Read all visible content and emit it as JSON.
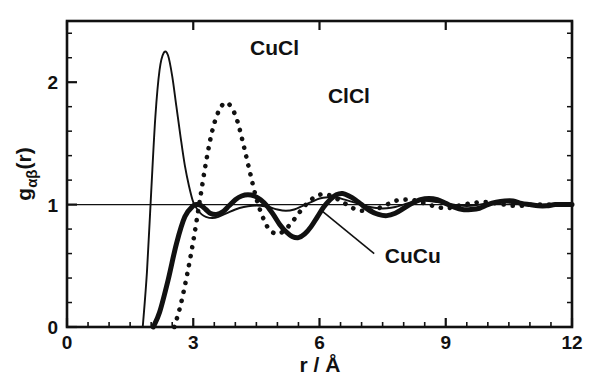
{
  "chart_data": {
    "type": "line",
    "title": "",
    "subtitle": "",
    "xlabel": "r / Å",
    "ylabel": "gαβ(r)",
    "ylabel_parts": {
      "base": "g",
      "subscript": "αβ",
      "suffix": "(r)"
    },
    "xlim": [
      0,
      12
    ],
    "ylim": [
      0,
      2.5
    ],
    "xticks": [
      0,
      3,
      6,
      9,
      12
    ],
    "xtick_labels": [
      "0",
      "3",
      "6",
      "9",
      "12"
    ],
    "yticks": [
      0,
      1,
      2
    ],
    "ytick_labels": [
      "0",
      "1",
      "2"
    ],
    "x_minor_step": 0.5,
    "y_minor_step": 0.2,
    "grid": false,
    "legend_position": "inline-annotations",
    "reference_line_y": 1,
    "annotations": [
      {
        "text": "CuCl",
        "x": 4.35,
        "y": 2.22,
        "leader": false
      },
      {
        "text": "ClCl",
        "x": 6.2,
        "y": 1.83,
        "leader": false
      },
      {
        "text": "CuCu",
        "x": 7.55,
        "y": 0.52,
        "leader": true,
        "leader_from": [
          6.05,
          0.95
        ],
        "leader_to": [
          7.3,
          0.6
        ]
      }
    ],
    "series": [
      {
        "name": "CuCl",
        "label": "CuCl",
        "style": "solid-thin",
        "color": "#111111",
        "x": [
          1.8,
          1.9,
          2.0,
          2.1,
          2.2,
          2.3,
          2.4,
          2.5,
          2.6,
          2.7,
          2.8,
          2.9,
          3.0,
          3.1,
          3.2,
          3.3,
          3.45,
          3.6,
          3.8,
          4.0,
          4.2,
          4.4,
          4.6,
          4.8,
          5.0,
          5.2,
          5.4,
          5.6,
          5.8,
          6.0,
          6.2,
          6.4,
          6.6,
          6.8,
          7.0,
          7.2,
          7.4,
          7.6,
          7.8,
          8.0,
          8.2,
          8.4,
          8.6,
          8.8,
          9.0,
          9.2,
          9.4,
          9.6,
          9.8,
          10.0,
          10.2,
          10.4,
          10.6,
          10.8,
          11.0,
          11.2,
          11.4,
          11.6,
          11.8,
          12.0
        ],
        "y": [
          0.0,
          0.45,
          1.1,
          1.72,
          2.1,
          2.24,
          2.22,
          2.05,
          1.8,
          1.55,
          1.32,
          1.15,
          1.02,
          0.96,
          0.92,
          0.9,
          0.89,
          0.9,
          0.93,
          0.96,
          0.98,
          0.99,
          0.99,
          0.98,
          0.96,
          0.95,
          0.96,
          0.99,
          1.02,
          1.05,
          1.06,
          1.06,
          1.04,
          1.02,
          1.0,
          0.98,
          0.97,
          0.97,
          0.98,
          1.0,
          1.02,
          1.03,
          1.03,
          1.02,
          1.01,
          1.0,
          0.99,
          0.99,
          1.0,
          1.01,
          1.02,
          1.02,
          1.01,
          1.0,
          1.0,
          1.0,
          1.0,
          1.0,
          1.0,
          1.0
        ]
      },
      {
        "name": "ClCl",
        "label": "ClCl",
        "style": "dotted",
        "color": "#111111",
        "x": [
          2.55,
          2.7,
          2.85,
          3.0,
          3.15,
          3.3,
          3.45,
          3.6,
          3.75,
          3.9,
          4.05,
          4.2,
          4.35,
          4.5,
          4.65,
          4.8,
          5.0,
          5.2,
          5.4,
          5.6,
          5.8,
          6.0,
          6.2,
          6.4,
          6.6,
          6.8,
          7.0,
          7.2,
          7.4,
          7.6,
          7.8,
          8.0,
          8.2,
          8.4,
          8.6,
          8.8,
          9.0,
          9.2,
          9.4,
          9.6,
          9.8,
          10.0,
          10.2,
          10.4,
          10.6,
          10.8,
          11.0,
          11.2,
          11.4,
          11.6,
          11.8,
          12.0
        ],
        "y": [
          0.0,
          0.18,
          0.42,
          0.7,
          1.02,
          1.34,
          1.6,
          1.76,
          1.83,
          1.8,
          1.68,
          1.48,
          1.26,
          1.05,
          0.9,
          0.8,
          0.76,
          0.8,
          0.88,
          0.97,
          1.04,
          1.08,
          1.08,
          1.05,
          1.01,
          0.97,
          0.95,
          0.95,
          0.97,
          1.0,
          1.03,
          1.04,
          1.04,
          1.02,
          1.0,
          0.98,
          0.97,
          0.98,
          1.0,
          1.01,
          1.02,
          1.02,
          1.01,
          1.0,
          0.99,
          0.99,
          1.0,
          1.0,
          1.0,
          1.0,
          1.0,
          1.0
        ]
      },
      {
        "name": "CuCu",
        "label": "CuCu",
        "style": "solid-thick",
        "color": "#111111",
        "x": [
          2.05,
          2.2,
          2.4,
          2.6,
          2.8,
          3.0,
          3.1,
          3.2,
          3.3,
          3.4,
          3.55,
          3.7,
          3.85,
          4.0,
          4.15,
          4.3,
          4.45,
          4.6,
          4.75,
          4.9,
          5.05,
          5.2,
          5.35,
          5.5,
          5.65,
          5.8,
          5.95,
          6.1,
          6.25,
          6.4,
          6.55,
          6.7,
          6.85,
          7.0,
          7.2,
          7.4,
          7.6,
          7.8,
          8.0,
          8.2,
          8.4,
          8.6,
          8.8,
          9.0,
          9.2,
          9.4,
          9.6,
          9.8,
          10.0,
          10.2,
          10.4,
          10.6,
          10.8,
          11.0,
          11.2,
          11.4,
          11.6,
          11.8,
          12.0
        ],
        "y": [
          0.0,
          0.12,
          0.38,
          0.68,
          0.9,
          0.99,
          1.0,
          0.99,
          0.96,
          0.93,
          0.92,
          0.94,
          0.99,
          1.04,
          1.07,
          1.08,
          1.07,
          1.04,
          0.99,
          0.92,
          0.84,
          0.78,
          0.74,
          0.73,
          0.76,
          0.82,
          0.9,
          0.98,
          1.04,
          1.08,
          1.09,
          1.07,
          1.04,
          1.0,
          0.95,
          0.92,
          0.91,
          0.93,
          0.97,
          1.01,
          1.04,
          1.05,
          1.04,
          1.01,
          0.98,
          0.96,
          0.96,
          0.97,
          1.0,
          1.02,
          1.03,
          1.03,
          1.01,
          1.0,
          0.99,
          0.99,
          1.0,
          1.0,
          1.0
        ]
      }
    ]
  },
  "axes": {
    "x_title": "r / Å",
    "y_base": "g",
    "y_sub": "αβ",
    "y_suffix": "(r)"
  },
  "colors": {
    "ink": "#111111",
    "background": "#ffffff"
  }
}
